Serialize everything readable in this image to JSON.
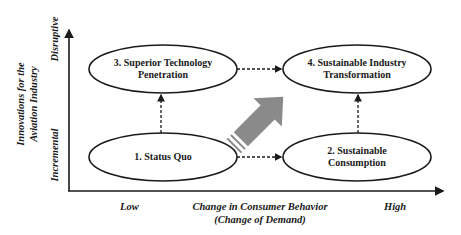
{
  "diagram": {
    "y_axis": {
      "title_line1": "Innovations for the",
      "title_line2": "Aviation Industry",
      "low_label": "Incremental",
      "high_label": "Disruptive"
    },
    "x_axis": {
      "title_line1": "Change in Consumer Behavior",
      "title_line2": "(Change of Demand)",
      "low_label": "Low",
      "high_label": "High"
    },
    "nodes": [
      {
        "id": 1,
        "line1": "1. Status Quo",
        "line2": ""
      },
      {
        "id": 2,
        "line1": "2. Sustainable",
        "line2": "Consumption"
      },
      {
        "id": 3,
        "line1": "3. Superior Technology",
        "line2": "Penetration"
      },
      {
        "id": 4,
        "line1": "4. Sustainable Industry",
        "line2": "Transformation"
      }
    ],
    "edges": [
      {
        "from": 1,
        "to": 2,
        "style": "dashed"
      },
      {
        "from": 1,
        "to": 3,
        "style": "dashed"
      },
      {
        "from": 3,
        "to": 4,
        "style": "dashed"
      },
      {
        "from": 2,
        "to": 4,
        "style": "dashed"
      }
    ],
    "colors": {
      "line": "#1a1a1a",
      "big_arrow": "#8a8a8a"
    }
  }
}
